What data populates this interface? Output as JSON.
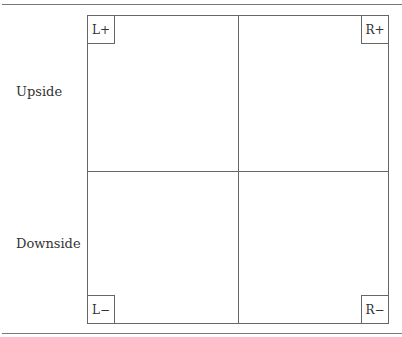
{
  "diagram": {
    "row_labels": {
      "upside": "Upside",
      "downside": "Downside"
    },
    "corners": {
      "top_left": "L+",
      "top_right": "R+",
      "bottom_left": "L−",
      "bottom_right": "R−"
    },
    "colors": {
      "line": "#666666",
      "text": "#333333",
      "background": "#ffffff"
    }
  }
}
